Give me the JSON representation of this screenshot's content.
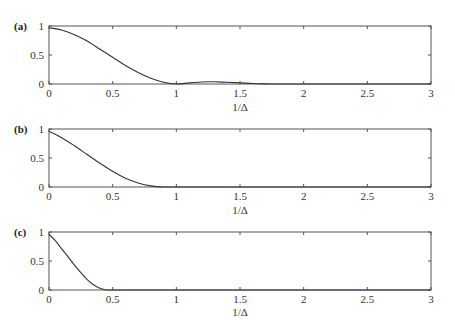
{
  "chart_data": [
    {
      "type": "line",
      "panel_label": "(a)",
      "xlabel": "1/Δ",
      "ylabel": "",
      "xlim": [
        0,
        3
      ],
      "ylim": [
        0,
        1
      ],
      "xticks": [
        "0",
        "0.5",
        "1",
        "1.5",
        "2",
        "2.5",
        "3"
      ],
      "yticks": [
        "0",
        "0.5",
        "1"
      ],
      "grid": false,
      "series": [
        {
          "name": "a",
          "x": [
            0,
            0.1,
            0.2,
            0.3,
            0.4,
            0.5,
            0.6,
            0.7,
            0.8,
            0.9,
            1.0,
            1.1,
            1.2,
            1.25,
            1.3,
            1.4,
            1.5,
            1.6,
            1.7,
            1.8,
            2.0,
            2.5,
            3.0
          ],
          "y": [
            0.97,
            0.93,
            0.85,
            0.74,
            0.6,
            0.46,
            0.32,
            0.2,
            0.1,
            0.03,
            0.0,
            0.02,
            0.035,
            0.04,
            0.038,
            0.03,
            0.02,
            0.008,
            0.002,
            0.0,
            0.0,
            0.0,
            0.0
          ]
        }
      ]
    },
    {
      "type": "line",
      "panel_label": "(b)",
      "xlabel": "1/Δ",
      "ylabel": "",
      "xlim": [
        0,
        3
      ],
      "ylim": [
        0,
        1
      ],
      "xticks": [
        "0",
        "0.5",
        "1",
        "1.5",
        "2",
        "2.5",
        "3"
      ],
      "yticks": [
        "0",
        "0.5",
        "1"
      ],
      "grid": false,
      "series": [
        {
          "name": "b",
          "x": [
            0,
            0.1,
            0.2,
            0.3,
            0.4,
            0.5,
            0.6,
            0.7,
            0.8,
            0.9,
            1.0,
            1.5,
            2.0,
            2.5,
            3.0
          ],
          "y": [
            0.96,
            0.85,
            0.71,
            0.56,
            0.41,
            0.27,
            0.15,
            0.07,
            0.02,
            0.0,
            0.0,
            0.0,
            0.0,
            0.0,
            0.0
          ]
        }
      ]
    },
    {
      "type": "line",
      "panel_label": "(c)",
      "xlabel": "1/Δ",
      "ylabel": "",
      "xlim": [
        0,
        3
      ],
      "ylim": [
        0,
        1
      ],
      "xticks": [
        "0",
        "0.5",
        "1",
        "1.5",
        "2",
        "2.5",
        "3"
      ],
      "yticks": [
        "0",
        "0.5",
        "1"
      ],
      "grid": false,
      "series": [
        {
          "name": "c",
          "x": [
            0,
            0.05,
            0.1,
            0.15,
            0.2,
            0.25,
            0.3,
            0.35,
            0.4,
            0.45,
            0.5,
            1.0,
            1.5,
            2.0,
            2.5,
            3.0
          ],
          "y": [
            0.96,
            0.85,
            0.71,
            0.57,
            0.43,
            0.3,
            0.18,
            0.09,
            0.03,
            0.0,
            0.0,
            0.0,
            0.0,
            0.0,
            0.0,
            0.0
          ]
        }
      ]
    }
  ]
}
